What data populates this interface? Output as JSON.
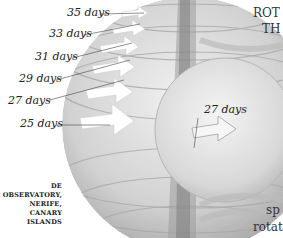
{
  "diagram": {
    "surface_labels": [
      {
        "text": "35 days"
      },
      {
        "text": "33 days"
      },
      {
        "text": "31 days"
      },
      {
        "text": "29 days"
      },
      {
        "text": "27 days"
      },
      {
        "text": "25 days"
      }
    ],
    "interior_label": "27 days",
    "caption_lines": [
      "DE OBSERVATORY,",
      "NERIFE, CANARY",
      "ISLANDS"
    ],
    "side_text_top": [
      "ROT",
      "TH"
    ],
    "side_text_bottom": [
      "sp",
      "rotat"
    ],
    "colors": {
      "background": "#ffffff",
      "sphere_light": "#e6e6e6",
      "sphere_mid": "#c8c8c8",
      "sphere_dark": "#8e8e8e",
      "arrow": "#ffffff",
      "text": "#222222"
    }
  }
}
